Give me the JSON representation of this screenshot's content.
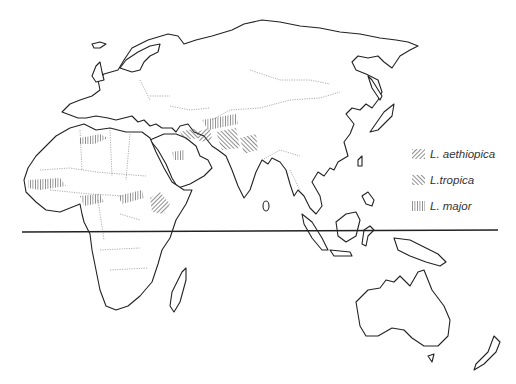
{
  "figure": {
    "type": "distribution map",
    "region": "Old World (Europe, Africa, Asia, Oceania)",
    "reference_line": "equator"
  },
  "legend": {
    "items": [
      {
        "label": "L. aethiopica",
        "pattern": "diagonal-hatch-ne"
      },
      {
        "label": "L.tropica",
        "pattern": "diagonal-hatch-nw"
      },
      {
        "label": "L. major",
        "pattern": "vertical-hatch"
      }
    ]
  },
  "colors": {
    "outline": "#222222",
    "border": "#777777",
    "hatch": "#333333",
    "background": "#ffffff"
  }
}
